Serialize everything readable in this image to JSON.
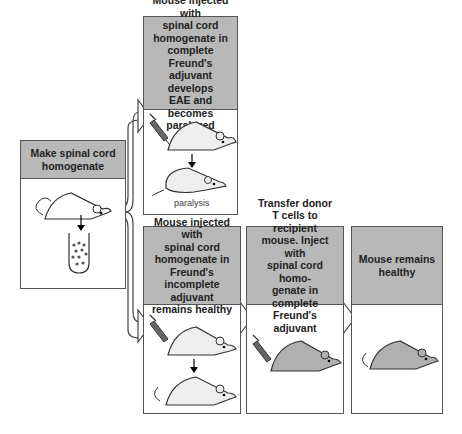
{
  "diagram": {
    "colors": {
      "header": "#b8b8b8",
      "border": "#555555",
      "mouse_light": "#eeeeee",
      "mouse_dark": "#b0b0b0",
      "syringe": "#666666"
    },
    "boxes": {
      "start": {
        "text": "Make spinal cord\nhomogenate"
      },
      "top": {
        "text": "Mouse injected with\nspinal cord\nhomogenate in\ncomplete Freund's\nadjuvant develops\nEAE and becomes\nparalyzed",
        "caption": "paralysis"
      },
      "bottom1": {
        "text": "Mouse injected with\nspinal cord\nhomogenate in\nFreund's incomplete\nadjuvant\nremains healthy"
      },
      "bottom2": {
        "text": "Transfer donor\nT cells to recipient\nmouse. Inject with\nspinal cord homo-\ngenate in complete\nFreund's adjuvant"
      },
      "bottom3": {
        "text": "Mouse remains\nhealthy"
      }
    }
  }
}
